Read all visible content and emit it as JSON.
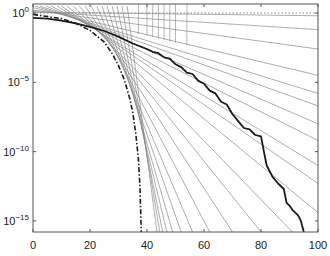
{
  "chart_data": {
    "type": "line",
    "title": "",
    "xlabel": "",
    "ylabel": "",
    "xscale": "linear",
    "yscale": "log",
    "xlim": [
      0,
      100
    ],
    "ylim_log10": [
      0.65,
      -15.8
    ],
    "grid": false,
    "legend": null,
    "x_ticks": [
      {
        "value": 0,
        "label": "0"
      },
      {
        "value": 20,
        "label": "20"
      },
      {
        "value": 40,
        "label": "40"
      },
      {
        "value": 60,
        "label": "60"
      },
      {
        "value": 80,
        "label": "80"
      },
      {
        "value": 100,
        "label": "100"
      }
    ],
    "y_ticks": [
      {
        "log10": 0,
        "base": "10",
        "exp": "0"
      },
      {
        "log10": -5,
        "base": "10",
        "exp": "−5"
      },
      {
        "log10": -10,
        "base": "10",
        "exp": "−10"
      },
      {
        "log10": -15,
        "base": "10",
        "exp": "−15"
      }
    ],
    "series": [
      {
        "name": "measured-error",
        "style": "solid-bold",
        "color": "#1a1a1a",
        "x_log10y": [
          [
            0,
            -0.35
          ],
          [
            5,
            -0.4
          ],
          [
            10,
            -0.55
          ],
          [
            15,
            -0.75
          ],
          [
            20,
            -1.0
          ],
          [
            25,
            -1.3
          ],
          [
            30,
            -1.7
          ],
          [
            35,
            -2.2
          ],
          [
            40,
            -2.6
          ],
          [
            42,
            -2.8
          ],
          [
            44,
            -2.9
          ],
          [
            46,
            -3.2
          ],
          [
            48,
            -3.3
          ],
          [
            50,
            -3.7
          ],
          [
            52,
            -3.9
          ],
          [
            54,
            -4.3
          ],
          [
            56,
            -4.4
          ],
          [
            58,
            -4.9
          ],
          [
            60,
            -5.1
          ],
          [
            62,
            -5.6
          ],
          [
            64,
            -5.8
          ],
          [
            66,
            -6.4
          ],
          [
            68,
            -6.6
          ],
          [
            70,
            -7.3
          ],
          [
            72,
            -7.8
          ],
          [
            74,
            -8.3
          ],
          [
            76,
            -8.4
          ],
          [
            78,
            -8.8
          ],
          [
            80,
            -8.9
          ],
          [
            81,
            -10.0
          ],
          [
            82,
            -11.0
          ],
          [
            84,
            -11.8
          ],
          [
            86,
            -12.3
          ],
          [
            88,
            -12.7
          ],
          [
            89,
            -13.7
          ],
          [
            90,
            -13.9
          ],
          [
            91,
            -14.2
          ],
          [
            93,
            -14.6
          ],
          [
            94,
            -15.0
          ],
          [
            95,
            -15.8
          ]
        ]
      },
      {
        "name": "bound",
        "style": "dash-dot",
        "color": "#1a1a1a",
        "x_log10y": [
          [
            0,
            -0.1
          ],
          [
            10,
            -0.4
          ],
          [
            15,
            -0.75
          ],
          [
            20,
            -1.25
          ],
          [
            25,
            -2.1
          ],
          [
            28,
            -3.0
          ],
          [
            30,
            -3.8
          ],
          [
            32,
            -4.8
          ],
          [
            34,
            -6.2
          ],
          [
            35,
            -7.2
          ],
          [
            36,
            -8.6
          ],
          [
            37,
            -10.5
          ],
          [
            37.5,
            -12.5
          ],
          [
            38,
            -15.8
          ]
        ]
      },
      {
        "name": "reference",
        "style": "dotted",
        "color": "#888888",
        "x_log10y": [
          [
            0,
            0
          ],
          [
            100,
            0
          ]
        ]
      }
    ],
    "tangent_lines": {
      "color": "#8a8a8a",
      "description": "fan of straight lines tangent to the upper envelope; each line starts at the top-left and ends at (100, log10y) or on the bottom axis at x",
      "lines": [
        {
          "start": [
            0,
            0.0
          ],
          "end": [
            100,
            -0.2
          ]
        },
        {
          "start": [
            0,
            0.0
          ],
          "end": [
            100,
            -1.2
          ]
        },
        {
          "start": [
            0,
            0.0
          ],
          "end": [
            100,
            -2.6
          ]
        },
        {
          "start": [
            0,
            0.0
          ],
          "end": [
            100,
            -4.5
          ]
        },
        {
          "start": [
            0,
            0.0
          ],
          "end": [
            100,
            -5.8
          ]
        },
        {
          "start": [
            0,
            0.0
          ],
          "end": [
            100,
            -6.7
          ]
        },
        {
          "start": [
            0,
            0.0
          ],
          "end": [
            100,
            -8.0
          ]
        },
        {
          "start": [
            0,
            0.0
          ],
          "end": [
            100,
            -9.2
          ]
        },
        {
          "start": [
            0,
            0.0
          ],
          "end": [
            100,
            -11.0
          ]
        },
        {
          "start": [
            0,
            0.0
          ],
          "end": [
            100,
            -12.3
          ]
        },
        {
          "start": [
            0,
            0.0
          ],
          "end": [
            100,
            -14.4
          ]
        },
        {
          "start": [
            0,
            0.0
          ],
          "end": [
            91,
            -15.8
          ]
        },
        {
          "start": [
            0,
            0.0
          ],
          "end": [
            80,
            -15.8
          ]
        },
        {
          "start": [
            0,
            0.0
          ],
          "end": [
            70,
            -15.8
          ]
        },
        {
          "start": [
            0,
            0.0
          ],
          "end": [
            62,
            -15.8
          ]
        },
        {
          "start": [
            0,
            0.0
          ],
          "end": [
            56,
            -15.8
          ]
        },
        {
          "start": [
            0,
            0.0
          ],
          "end": [
            52,
            -15.8
          ]
        },
        {
          "start": [
            0,
            0.0
          ],
          "end": [
            49,
            -15.8
          ]
        },
        {
          "start": [
            0,
            0.0
          ],
          "end": [
            47,
            -15.8
          ]
        },
        {
          "start": [
            0,
            0.0
          ],
          "end": [
            45.5,
            -15.8
          ]
        },
        {
          "start": [
            0,
            0.0
          ],
          "end": [
            44.5,
            -15.8
          ]
        },
        {
          "start": [
            0,
            0.0
          ],
          "end": [
            43.5,
            -15.8
          ]
        }
      ],
      "vertical_stems_x": [
        37,
        40,
        42,
        44,
        46,
        48,
        50,
        54
      ]
    }
  }
}
